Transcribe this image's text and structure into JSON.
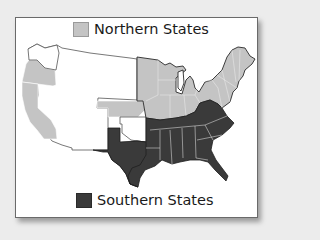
{
  "legend": {
    "northern": {
      "label": "Northern States",
      "color": "#c4c4c4"
    },
    "southern": {
      "label": "Southern States",
      "color": "#3a3a3a"
    }
  },
  "colors": {
    "territory": "#ffffff",
    "northern": "#c4c4c4",
    "southern": "#3a3a3a",
    "state_border": "#f4f4f4",
    "background": "#ececec"
  },
  "map": {
    "title_implied": "Northern and Southern States",
    "regions": [
      {
        "name": "West Coast (Washington Territory)",
        "group": "territory"
      },
      {
        "name": "Oregon",
        "group": "northern"
      },
      {
        "name": "California",
        "group": "northern"
      },
      {
        "name": "Western Territories",
        "group": "territory"
      },
      {
        "name": "Kansas",
        "group": "northern"
      },
      {
        "name": "Indian Territory",
        "group": "territory"
      },
      {
        "name": "Texas",
        "group": "southern"
      },
      {
        "name": "Midwest States",
        "group": "northern"
      },
      {
        "name": "Northeast States",
        "group": "northern"
      },
      {
        "name": "Southeast States",
        "group": "southern"
      }
    ]
  }
}
